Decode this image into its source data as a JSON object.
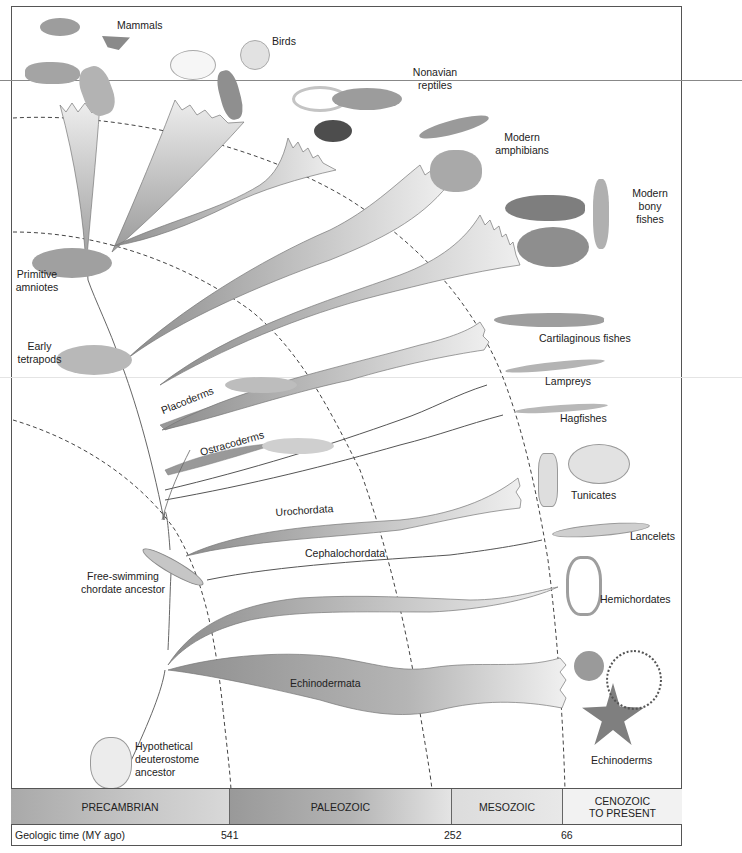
{
  "diagram": {
    "type": "phylogenetic tree of deuterostomes over geologic time",
    "taxa_labels": {
      "mammals": "Mammals",
      "birds": "Birds",
      "nonavian_reptiles_1": "Nonavian",
      "nonavian_reptiles_2": "reptiles",
      "modern_amphibians_1": "Modern",
      "modern_amphibians_2": "amphibians",
      "modern_bony_fishes_1": "Modern",
      "modern_bony_fishes_2": "bony",
      "modern_bony_fishes_3": "fishes",
      "primitive_amniotes_1": "Primitive",
      "primitive_amniotes_2": "amniotes",
      "early_tetrapods_1": "Early",
      "early_tetrapods_2": "tetrapods",
      "cartilaginous_fishes": "Cartilaginous fishes",
      "lampreys": "Lampreys",
      "hagfishes": "Hagfishes",
      "tunicates": "Tunicates",
      "lancelets": "Lancelets",
      "hemichordates": "Hemichordates",
      "echinoderms": "Echinoderms",
      "free_swimming_1": "Free-swimming",
      "free_swimming_2": "chordate ancestor",
      "hypothetical_1": "Hypothetical",
      "hypothetical_2": "deuterostome",
      "hypothetical_3": "ancestor"
    },
    "branch_labels": {
      "placoderms": "Placoderms",
      "ostracoderms": "Ostracoderms",
      "urochordata": "Urochordata",
      "cephalochordata": "Cephalochordata",
      "echinodermata": "Echinodermata"
    },
    "eras": [
      {
        "name": "PRECAMBRIAN"
      },
      {
        "name": "PALEOZOIC"
      },
      {
        "name": "MESOZOIC"
      },
      {
        "name": "CENOZOIC",
        "name2": "TO PRESENT"
      }
    ],
    "timeline": {
      "label": "Geologic time (MY ago)",
      "ticks": [
        "541",
        "252",
        "66"
      ]
    },
    "colors": {
      "branch_dark": "#8a8a8a",
      "branch_light": "#e6e6e6",
      "line": "#555555",
      "frame": "#555555"
    }
  }
}
